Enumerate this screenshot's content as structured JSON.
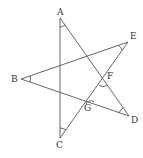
{
  "diagram": {
    "stroke_color": "#555555",
    "background": "#ffffff",
    "points": {
      "A": {
        "label": "A",
        "x": 60,
        "y": 18
      },
      "B": {
        "label": "B",
        "x": 21,
        "y": 79
      },
      "C": {
        "label": "C",
        "x": 60,
        "y": 138
      },
      "D": {
        "label": "D",
        "x": 129,
        "y": 116
      },
      "E": {
        "label": "E",
        "x": 128,
        "y": 42
      },
      "F": {
        "label": "F",
        "x": 103,
        "y": 80
      },
      "G": {
        "label": "G",
        "x": 89,
        "y": 100
      }
    },
    "segments": [
      [
        "A",
        "C"
      ],
      [
        "A",
        "D"
      ],
      [
        "B",
        "E"
      ],
      [
        "B",
        "D"
      ],
      [
        "E",
        "C"
      ]
    ],
    "angle_marks": [
      "A",
      "B",
      "C",
      "D",
      "E",
      "F",
      "G"
    ]
  }
}
